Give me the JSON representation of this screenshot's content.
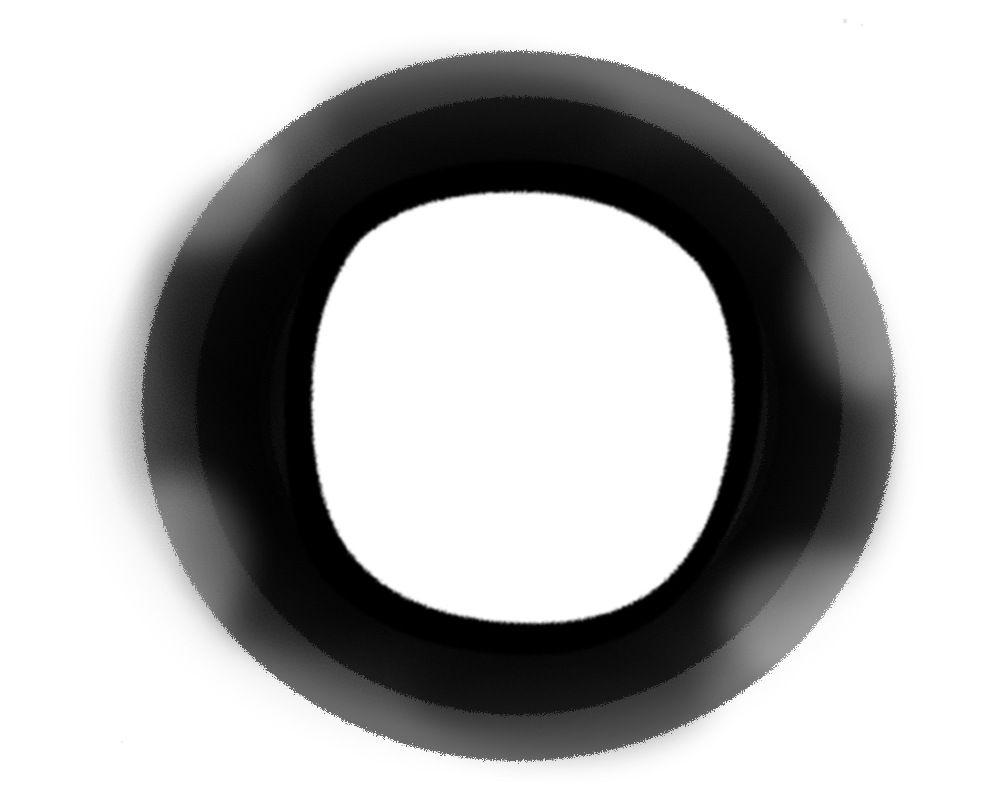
{
  "image": {
    "kind": "charcoal-drawing",
    "title": "Charcoal Ring",
    "subject": "hand-drawn circle outline",
    "width": 993,
    "height": 788,
    "background_color": "#ffffff",
    "ink_color": "#000000",
    "medium": "charcoal",
    "alt_text": "A thick black hand-drawn circle outline surrounded by a soft smudged charcoal halo on white paper, with a pure white disc in the center."
  },
  "palette": {
    "paper_white": "#ffffff",
    "pure_black": "#000000",
    "halo_dark": "#1a1a1a",
    "halo_mid": "#4d4d4d",
    "halo_light": "#b3b3b3",
    "speck_gray": "#e8e8e8"
  },
  "geometry": {
    "halo": {
      "center_x": 505,
      "center_y": 400,
      "radius_x": 425,
      "radius_y": 350,
      "left_edge": 85,
      "right_edge": 935,
      "top_edge": 55,
      "bottom_edge": 760
    },
    "ring_outer": {
      "center_x": 523,
      "center_y": 408,
      "radius_x": 239,
      "radius_y": 248,
      "left_edge": 284,
      "right_edge": 762,
      "top_edge": 160,
      "bottom_edge": 656
    },
    "ring_inner_white": {
      "center_x": 520,
      "center_y": 407,
      "radius_x": 215,
      "radius_y": 215,
      "left_edge": 305,
      "right_edge": 735,
      "top_edge": 192,
      "bottom_edge": 622
    },
    "ring_stroke_width": 26
  },
  "layers": [
    {
      "name": "paper-background",
      "label": "Paper background",
      "order": 0
    },
    {
      "name": "charcoal-halo",
      "label": "Smudged charcoal halo",
      "order": 1
    },
    {
      "name": "ring-stroke",
      "label": "Dense black ring stroke",
      "order": 2
    },
    {
      "name": "inner-disc",
      "label": "White inner disc",
      "order": 3
    },
    {
      "name": "stray-specks",
      "label": "Stray charcoal specks",
      "order": 4
    }
  ],
  "specks": [
    {
      "x": 845,
      "y": 21,
      "r": 2.2,
      "opacity": 0.1
    },
    {
      "x": 862,
      "y": 25,
      "r": 1.4,
      "opacity": 0.07
    },
    {
      "x": 122,
      "y": 742,
      "r": 1.6,
      "opacity": 0.05
    }
  ],
  "chart_data": {
    "type": "scatter",
    "title": "Charcoal Ring",
    "xlabel": "",
    "ylabel": "",
    "x": [
      505
    ],
    "y": [
      400
    ],
    "values": [
      1
    ],
    "categories": [
      "ring"
    ],
    "annotations": [
      "halo outer extent x: 85 to 935",
      "halo outer extent y: 55 to 760",
      "black ring outer diameter approx 478 x 496 px",
      "inner white disc diameter approx 430 px"
    ]
  }
}
